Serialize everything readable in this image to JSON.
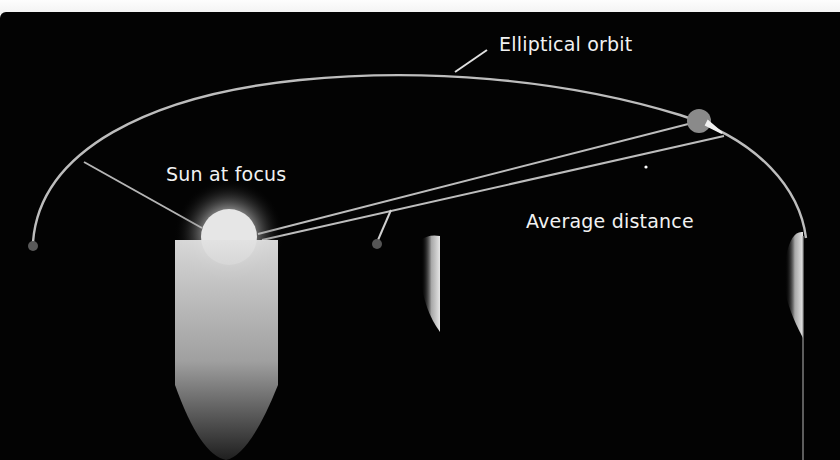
{
  "diagram": {
    "type": "orbital-diagram",
    "labels": {
      "orbit": "Elliptical orbit",
      "sun": "Sun at focus",
      "average_distance": "Average distance"
    },
    "colors": {
      "background": "#030303",
      "orbit_line": "#bdbdbd",
      "text": "#f2f2f2",
      "sun": "#e8e8e8",
      "planet": "#8a8a8a"
    },
    "elements": [
      {
        "name": "elliptical-orbit",
        "kind": "ellipse-arc"
      },
      {
        "name": "sun",
        "kind": "glowing-circle",
        "position": "focus"
      },
      {
        "name": "planet",
        "kind": "circle",
        "position": "on orbit, upper right"
      },
      {
        "name": "sun-to-planet-line",
        "kind": "line"
      },
      {
        "name": "average-distance-line",
        "kind": "line"
      },
      {
        "name": "perihelion-pointer",
        "kind": "line",
        "to": "orbit upper left"
      },
      {
        "name": "direction-arrow",
        "kind": "arrow",
        "at": "planet"
      }
    ]
  }
}
